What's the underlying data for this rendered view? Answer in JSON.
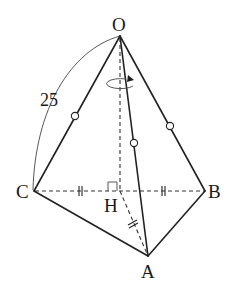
{
  "figure": {
    "type": "pyramid-rotation-diagram",
    "vertices": {
      "O": {
        "label": "O"
      },
      "A": {
        "label": "A"
      },
      "B": {
        "label": "B"
      },
      "C": {
        "label": "C"
      },
      "H": {
        "label": "H"
      }
    },
    "measurements": {
      "arc_OC_length": "25"
    },
    "equal_length_markers": {
      "circle": [
        "OC",
        "OA",
        "OB"
      ],
      "double_tick": [
        "CH",
        "HB",
        "HA"
      ]
    },
    "right_angle_at": "H",
    "rotation_axis": "OH"
  }
}
